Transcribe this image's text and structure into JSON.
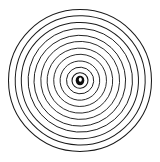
{
  "figure": {
    "type": "concentric-circles",
    "background_color": "#ffffff",
    "stroke_color": "#1a1a1a",
    "center_dot_color": "#0d0d0d",
    "center_highlight_color": "#ffffff",
    "center": {
      "x": 80,
      "y": 80.5
    },
    "ring_count": 11,
    "outer_radius": 71.5,
    "rings": [
      {
        "index": 1,
        "radius": 71.5,
        "stroke_width": 1.05,
        "rx": 71.5,
        "ry": 71.0,
        "cx": 80.0,
        "cy": 80.5,
        "rotation": 0
      },
      {
        "index": 2,
        "radius": 65.0,
        "stroke_width": 1.0,
        "rx": 65.0,
        "ry": 64.6,
        "cx": 80.2,
        "cy": 80.4,
        "rotation": 2
      },
      {
        "index": 3,
        "radius": 58.6,
        "stroke_width": 1.0,
        "rx": 58.6,
        "ry": 58.2,
        "cx": 79.9,
        "cy": 80.6,
        "rotation": -3
      },
      {
        "index": 4,
        "radius": 52.2,
        "stroke_width": 0.95,
        "rx": 52.2,
        "ry": 51.8,
        "cx": 80.3,
        "cy": 80.3,
        "rotation": 4
      },
      {
        "index": 5,
        "radius": 45.8,
        "stroke_width": 0.95,
        "rx": 45.8,
        "ry": 45.4,
        "cx": 79.8,
        "cy": 80.7,
        "rotation": -2
      },
      {
        "index": 6,
        "radius": 39.4,
        "stroke_width": 0.9,
        "rx": 39.4,
        "ry": 39.0,
        "cx": 80.2,
        "cy": 80.4,
        "rotation": 3
      },
      {
        "index": 7,
        "radius": 32.8,
        "stroke_width": 0.9,
        "rx": 32.8,
        "ry": 32.5,
        "cx": 79.9,
        "cy": 80.6,
        "rotation": -4
      },
      {
        "index": 8,
        "radius": 26.4,
        "stroke_width": 0.9,
        "rx": 26.4,
        "ry": 26.1,
        "cx": 80.1,
        "cy": 80.4,
        "rotation": 2
      },
      {
        "index": 9,
        "radius": 19.8,
        "stroke_width": 0.9,
        "rx": 19.8,
        "ry": 19.6,
        "cx": 79.9,
        "cy": 80.6,
        "rotation": -5
      },
      {
        "index": 10,
        "radius": 13.6,
        "stroke_width": 0.95,
        "rx": 13.6,
        "ry": 13.3,
        "cx": 80.1,
        "cy": 80.5,
        "rotation": 5
      },
      {
        "index": 11,
        "radius": 8.0,
        "stroke_width": 1.1,
        "rx": 8.0,
        "ry": 7.8,
        "cx": 80.0,
        "cy": 80.5,
        "rotation": -3
      }
    ],
    "center_dot": {
      "cx": 80.0,
      "cy": 80.5,
      "rx": 4.3,
      "ry": 4.8
    },
    "center_highlight": {
      "cx": 80.3,
      "cy": 79.6,
      "rx": 1.5,
      "ry": 2.2
    }
  }
}
